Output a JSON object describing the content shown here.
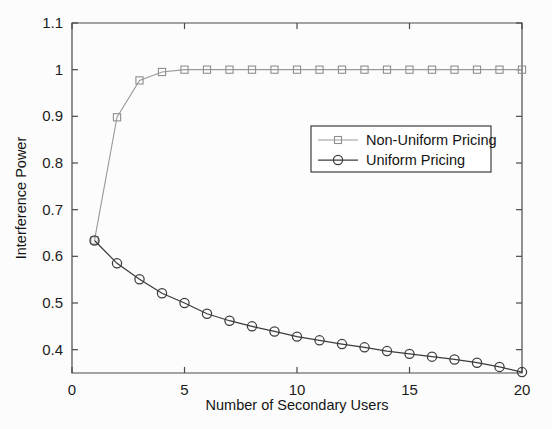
{
  "chart_data": {
    "type": "line",
    "title": "",
    "xlabel": "Number of Secondary Users",
    "ylabel": "Interference Power",
    "xlim": [
      0,
      20
    ],
    "ylim": [
      0.35,
      1.1
    ],
    "grid": false,
    "legend_position": "center-right",
    "x_ticks": [
      "0",
      "5",
      "10",
      "15",
      "20"
    ],
    "x_tick_values": [
      0,
      5,
      10,
      15,
      20
    ],
    "y_ticks": [
      "0.4",
      "0.5",
      "0.6",
      "0.7",
      "0.8",
      "0.9",
      "1",
      "1.1"
    ],
    "y_tick_values": [
      0.4,
      0.5,
      0.6,
      0.7,
      0.8,
      0.9,
      1.0,
      1.1
    ],
    "x": [
      1,
      2,
      3,
      4,
      5,
      6,
      7,
      8,
      9,
      10,
      11,
      12,
      13,
      14,
      15,
      16,
      17,
      18,
      19,
      20
    ],
    "series": [
      {
        "name": "Non-Uniform Pricing",
        "marker": "square",
        "color": "#8f8f8f",
        "values": [
          0.634,
          0.898,
          0.977,
          0.995,
          1.0,
          1.0,
          1.0,
          1.0,
          1.0,
          1.0,
          1.0,
          1.0,
          1.0,
          1.0,
          1.0,
          1.0,
          1.0,
          1.0,
          1.0,
          1.0
        ]
      },
      {
        "name": "Uniform Pricing",
        "marker": "circle",
        "color": "#3c3c3c",
        "values": [
          0.634,
          0.585,
          0.551,
          0.521,
          0.5,
          0.477,
          0.462,
          0.45,
          0.439,
          0.428,
          0.42,
          0.412,
          0.405,
          0.397,
          0.391,
          0.385,
          0.379,
          0.372,
          0.363,
          0.352
        ]
      }
    ]
  },
  "legend": {
    "entries": [
      {
        "label": "Non-Uniform Pricing"
      },
      {
        "label": "Uniform Pricing"
      }
    ]
  }
}
